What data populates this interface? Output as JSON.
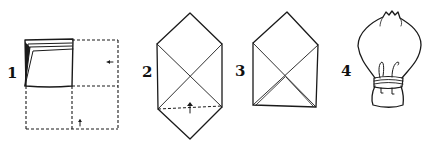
{
  "diagram": {
    "type": "folding-steps",
    "steps": [
      {
        "number": "1",
        "description": "napkin folded into quarters, open corners at top left; dashed outline shows unfolded square with arrows"
      },
      {
        "number": "2",
        "description": "diamond shape with crease X; bottom dashed fold line with upward arrow"
      },
      {
        "number": "3",
        "description": "bottom point folded up forming envelope shape"
      },
      {
        "number": "4",
        "description": "finished bulb/flower shape tied with band"
      }
    ]
  },
  "colors": {
    "ink": "#1a1a1a",
    "background": "#ffffff"
  }
}
